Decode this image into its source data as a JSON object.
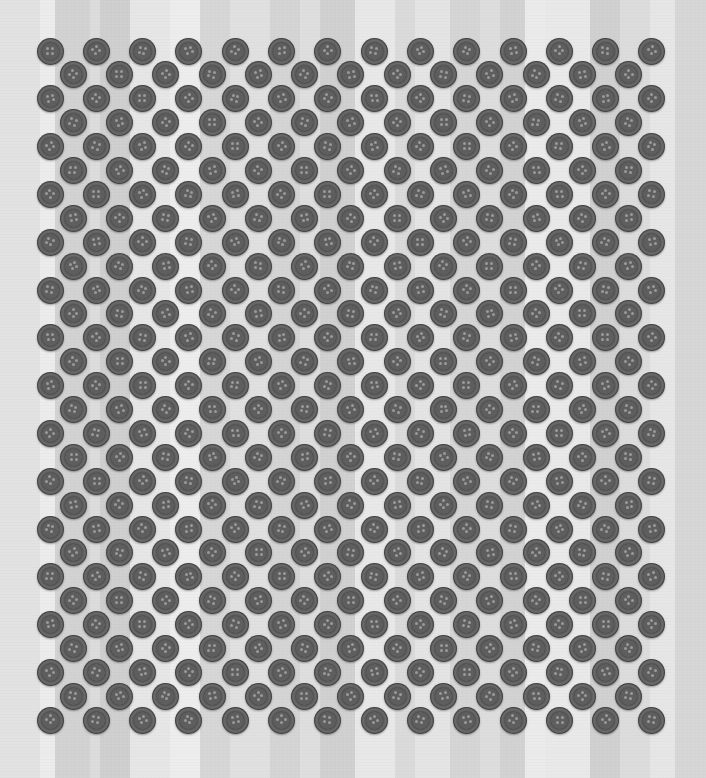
{
  "scene": {
    "description": "Grid of dark grey four-hole buttons in staggered hexagonal rows on a light grey vertically striped fabric background",
    "width": 706,
    "height": 778,
    "background_color": "#e0e0e0"
  },
  "stripes": [
    {
      "x": 0,
      "w": 40,
      "color": "#e2e2e2"
    },
    {
      "x": 40,
      "w": 15,
      "color": "#ececec"
    },
    {
      "x": 55,
      "w": 35,
      "color": "#d2d2d2"
    },
    {
      "x": 90,
      "w": 10,
      "color": "#dcdcdc"
    },
    {
      "x": 100,
      "w": 30,
      "color": "#cfcfcf"
    },
    {
      "x": 130,
      "w": 40,
      "color": "#e6e6e6"
    },
    {
      "x": 170,
      "w": 30,
      "color": "#ededed"
    },
    {
      "x": 200,
      "w": 30,
      "color": "#d6d6d6"
    },
    {
      "x": 230,
      "w": 40,
      "color": "#e0e0e0"
    },
    {
      "x": 270,
      "w": 30,
      "color": "#d4d4d4"
    },
    {
      "x": 300,
      "w": 20,
      "color": "#dedede"
    },
    {
      "x": 320,
      "w": 35,
      "color": "#d0d0d0"
    },
    {
      "x": 355,
      "w": 40,
      "color": "#e8e8e8"
    },
    {
      "x": 395,
      "w": 20,
      "color": "#dadada"
    },
    {
      "x": 415,
      "w": 35,
      "color": "#e4e4e4"
    },
    {
      "x": 450,
      "w": 30,
      "color": "#d5d5d5"
    },
    {
      "x": 480,
      "w": 20,
      "color": "#dddddd"
    },
    {
      "x": 500,
      "w": 25,
      "color": "#d2d2d2"
    },
    {
      "x": 525,
      "w": 20,
      "color": "#ebebeb"
    },
    {
      "x": 545,
      "w": 45,
      "color": "#e9e9e9"
    },
    {
      "x": 590,
      "w": 30,
      "color": "#d0d0d0"
    },
    {
      "x": 620,
      "w": 30,
      "color": "#dcdcdc"
    },
    {
      "x": 650,
      "w": 25,
      "color": "#e6e6e6"
    },
    {
      "x": 675,
      "w": 31,
      "color": "#d6d6d6"
    }
  ],
  "button_grid": {
    "rows": 29,
    "odd_row_count": 14,
    "even_row_count": 13,
    "first_center_x": 50,
    "first_center_y": 51,
    "pitch_x": 46.3,
    "pitch_y": 23.9,
    "even_row_offset_x": 23.15,
    "diameter": 27,
    "holes_per_button": 4,
    "button_color": "#5a5a5a",
    "hole_color": "#9a9a9a",
    "total_buttons": 392
  }
}
